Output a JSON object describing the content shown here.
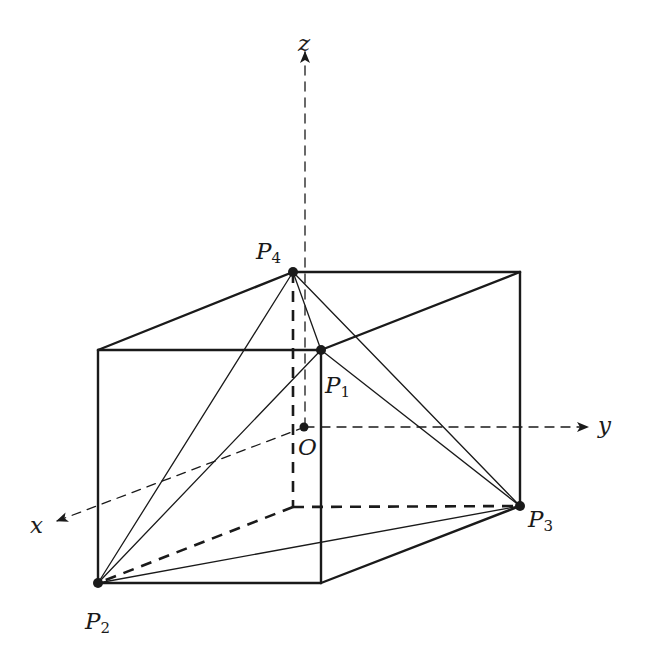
{
  "diagram": {
    "colors": {
      "background": "#ffffff",
      "stroke": "#1a1a1a"
    },
    "axes": {
      "x": {
        "label": "x",
        "from": [
          305,
          427
        ],
        "to": [
          55,
          522
        ]
      },
      "y": {
        "label": "y",
        "from": [
          305,
          427
        ],
        "to": [
          590,
          427
        ]
      },
      "z": {
        "label": "z",
        "from": [
          305,
          427
        ],
        "to": [
          305,
          50
        ]
      }
    },
    "origin": {
      "label": "O",
      "point": [
        305,
        427
      ]
    },
    "points": [
      {
        "name": "P",
        "sub": "1",
        "point": [
          321,
          350
        ]
      },
      {
        "name": "P",
        "sub": "2",
        "point": [
          98,
          583
        ]
      },
      {
        "name": "P",
        "sub": "3",
        "point": [
          520,
          506
        ]
      },
      {
        "name": "P",
        "sub": "4",
        "point": [
          293,
          272
        ]
      }
    ],
    "box_vertices": {
      "back_top_left": [
        293,
        272
      ],
      "back_top_right": [
        520,
        272
      ],
      "front_top_left": [
        98,
        350
      ],
      "front_top_right": [
        321,
        350
      ],
      "front_bottom_left": [
        98,
        583
      ],
      "front_bottom_right": [
        321,
        583
      ],
      "back_bottom_left": [
        293,
        507
      ],
      "back_bottom_right": [
        520,
        506
      ]
    }
  }
}
